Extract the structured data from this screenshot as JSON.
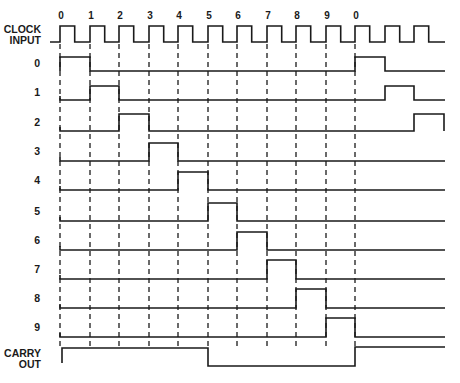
{
  "diagram": {
    "type": "timing-diagram",
    "clock_label_line1": "CLOCK",
    "clock_label_line2": "INPUT",
    "clock_ticks": [
      "0",
      "1",
      "2",
      "3",
      "4",
      "5",
      "6",
      "7",
      "8",
      "9",
      "0"
    ],
    "row_labels": [
      "0",
      "1",
      "2",
      "3",
      "4",
      "5",
      "6",
      "7",
      "8",
      "9"
    ],
    "carry_label_line1": "CARRY",
    "carry_label_line2": "OUT",
    "ink_color": "#1a1a1a",
    "background": "#ffffff",
    "edge_x": [
      60,
      90,
      119,
      149,
      178,
      208,
      237,
      267,
      296,
      326,
      355,
      385,
      414
    ],
    "clock": {
      "high_y": 26,
      "low_y": 42,
      "start_x": 50,
      "end_x": 445,
      "half_period": 14.7
    },
    "rows": [
      {
        "label": "0",
        "high_y": 57,
        "low_y": 71,
        "pulses": [
          [
            60,
            90
          ],
          [
            355,
            385
          ]
        ]
      },
      {
        "label": "1",
        "high_y": 86,
        "low_y": 100,
        "pulses": [
          [
            90,
            119
          ],
          [
            385,
            414
          ]
        ]
      },
      {
        "label": "2",
        "high_y": 114,
        "low_y": 131,
        "pulses": [
          [
            119,
            149
          ],
          [
            414,
            444
          ]
        ]
      },
      {
        "label": "3",
        "high_y": 143,
        "low_y": 161,
        "pulses": [
          [
            149,
            178
          ]
        ]
      },
      {
        "label": "4",
        "high_y": 172,
        "low_y": 190,
        "pulses": [
          [
            178,
            208
          ]
        ]
      },
      {
        "label": "5",
        "high_y": 203,
        "low_y": 221,
        "pulses": [
          [
            208,
            237
          ]
        ]
      },
      {
        "label": "6",
        "high_y": 232,
        "low_y": 250,
        "pulses": [
          [
            237,
            267
          ]
        ]
      },
      {
        "label": "7",
        "high_y": 260,
        "low_y": 279,
        "pulses": [
          [
            267,
            296
          ]
        ]
      },
      {
        "label": "8",
        "high_y": 289,
        "low_y": 308,
        "pulses": [
          [
            296,
            326
          ]
        ]
      },
      {
        "label": "9",
        "high_y": 318,
        "low_y": 337,
        "pulses": [
          [
            326,
            355
          ]
        ]
      }
    ],
    "carry": {
      "high_y": 348,
      "low_y": 366,
      "low_interval": [
        208,
        355
      ]
    },
    "dashed_lines": {
      "top_y": 44,
      "bottom_y": 346
    }
  }
}
